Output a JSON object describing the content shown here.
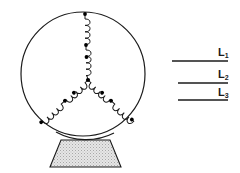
{
  "figure": {
    "type": "schematic",
    "colors": {
      "stroke": "#1b1b1b",
      "terminal_dot": "#000000",
      "base_fill": "#e2e2e2",
      "base_stipple": "#9a9a9a",
      "background": "#ffffff"
    },
    "machine": {
      "housing": {
        "shape": "circle",
        "center_x": 83,
        "center_y": 74,
        "radius": 62,
        "stroke_width": 1.2
      },
      "star_point": {
        "x": 88,
        "y": 80
      },
      "windings": [
        {
          "name": "winding-phase-1",
          "direction": "up",
          "outer_terminal": {
            "x": 85,
            "y": 14
          },
          "mid_terminal": {
            "x": 86,
            "y": 45
          },
          "coil_segments": 2,
          "coil_turns_per_segment": 4
        },
        {
          "name": "winding-phase-2",
          "direction": "down-left",
          "outer_terminal": {
            "x": 41,
            "y": 118
          },
          "mid_terminal": {
            "x": 64,
            "y": 99
          },
          "coil_segments": 2,
          "coil_turns_per_segment": 4
        },
        {
          "name": "winding-phase-3",
          "direction": "down-right",
          "outer_terminal": {
            "x": 128,
            "y": 123
          },
          "mid_terminal": {
            "x": 110,
            "y": 101
          },
          "coil_segments": 2,
          "coil_turns_per_segment": 4
        }
      ],
      "base": {
        "shape": "trapezoid",
        "fill": "stippled-gray",
        "top_left_x": 61,
        "top_right_x": 110,
        "top_y": 140,
        "bottom_left_x": 50,
        "bottom_right_x": 121,
        "bottom_y": 167
      }
    },
    "supply_lines": [
      {
        "id": "L1",
        "label": "L",
        "subscript": "1",
        "line_y": 61,
        "line_x_start": 172,
        "line_x_end": 228,
        "label_x": 221,
        "label_y": 47
      },
      {
        "id": "L2",
        "label": "L",
        "subscript": "2",
        "line_y": 83,
        "line_x_start": 178,
        "line_x_end": 228,
        "label_x": 221,
        "label_y": 69
      },
      {
        "id": "L3",
        "label": "L",
        "subscript": "3",
        "line_y": 100,
        "line_x_start": 178,
        "line_x_end": 228,
        "label_x": 221,
        "label_y": 87
      }
    ]
  }
}
